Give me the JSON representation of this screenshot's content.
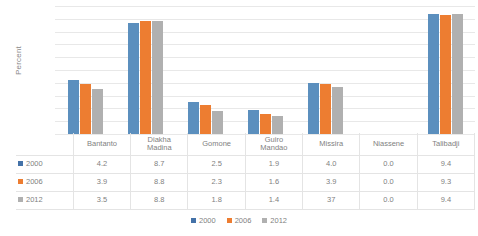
{
  "chart_data": {
    "type": "bar",
    "title": "",
    "subtitle": "",
    "xlabel": "",
    "ylabel": "Percent",
    "ylim": [
      0,
      10
    ],
    "grid": true,
    "gridline_count": 10,
    "y_tick_labels_visible": false,
    "legend_position": "bottom",
    "categories": [
      "Bantanto",
      "Diakha Madina",
      "Gomone",
      "Guiro Mandao",
      "Missira",
      "Niassene",
      "Talibadji"
    ],
    "category_label_lines": [
      [
        "Bantanto",
        ""
      ],
      [
        "Diakha",
        "Madina"
      ],
      [
        "Gomone",
        ""
      ],
      [
        "Guiro",
        "Mandao"
      ],
      [
        "Missira",
        ""
      ],
      [
        "Niassene",
        ""
      ],
      [
        "Talibadji",
        ""
      ]
    ],
    "series": [
      {
        "name": "2000",
        "color": "#5b8fbe",
        "key_color": "#4472a8",
        "values": [
          4.2,
          8.7,
          2.5,
          1.9,
          4.0,
          0.0,
          9.4
        ],
        "labels": [
          "4.2",
          "8.7",
          "2.5",
          "1.9",
          "4.0",
          "0.0",
          "9.4"
        ]
      },
      {
        "name": "2006",
        "color": "#ed7d31",
        "key_color": "#ed7d31",
        "values": [
          3.9,
          8.8,
          2.3,
          1.6,
          3.9,
          0.0,
          9.3
        ],
        "labels": [
          "3.9",
          "8.8",
          "2.3",
          "1.6",
          "3.9",
          "0.0",
          "9.3"
        ]
      },
      {
        "name": "2012",
        "color": "#b0b0b0",
        "key_color": "#b0b0b0",
        "values": [
          3.5,
          8.8,
          1.8,
          1.4,
          3.7,
          0.0,
          9.4
        ],
        "labels": [
          "3.5",
          "8.8",
          "1.8",
          "1.4",
          "37",
          "0.0",
          "9.4"
        ]
      }
    ]
  },
  "data_table": {
    "row_header_labels": [
      "2000",
      "2006",
      "2012"
    ],
    "column_headers": [
      "Bantanto",
      "Diakha Madina",
      "Gomone",
      "Guiro Mandao",
      "Missira",
      "Niassene",
      "Talibadji"
    ],
    "rows": [
      [
        "4.2",
        "8.7",
        "2.5",
        "1.9",
        "4.0",
        "0.0",
        "9.4"
      ],
      [
        "3.9",
        "8.8",
        "2.3",
        "1.6",
        "3.9",
        "0.0",
        "9.3"
      ],
      [
        "3.5",
        "8.8",
        "1.8",
        "1.4",
        "37",
        "0.0",
        "9.4"
      ]
    ]
  },
  "legend": {
    "items": [
      {
        "label": "2000",
        "color": "#4472a8"
      },
      {
        "label": "2006",
        "color": "#ed7d31"
      },
      {
        "label": "2012",
        "color": "#b0b0b0"
      }
    ]
  },
  "colors": {
    "series_2000": "#5b8fbe",
    "series_2006": "#ed7d31",
    "series_2012": "#b0b0b0",
    "gridline": "#e8e8e8",
    "table_border": "#e4e4e4",
    "text": "#7f7f7f",
    "background": "#ffffff"
  }
}
